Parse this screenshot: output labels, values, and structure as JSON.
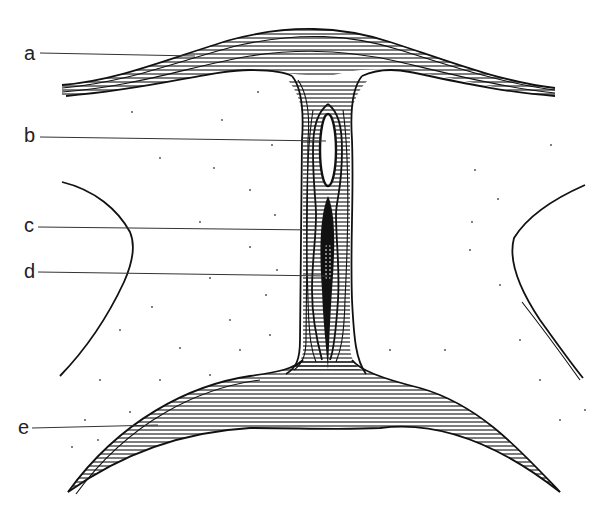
{
  "diagram": {
    "type": "anatomical line drawing (cross-section)",
    "style": "black ink on white, hatched fibrous bands, stippled tissue",
    "colors": {
      "ink": "#111111",
      "background": "#ffffff",
      "leader": "#333333"
    },
    "labels": [
      {
        "id": "a",
        "text": "a",
        "x": 24,
        "y": 60,
        "target": "upper curved fibrous band"
      },
      {
        "id": "b",
        "text": "b",
        "x": 24,
        "y": 142,
        "target": "oval lumen in central column"
      },
      {
        "id": "c",
        "text": "c",
        "x": 24,
        "y": 232,
        "target": "striated sheath around dark core"
      },
      {
        "id": "d",
        "text": "d",
        "x": 24,
        "y": 278,
        "target": "dark fusiform core with cross-hatched center"
      },
      {
        "id": "e",
        "text": "e",
        "x": 18,
        "y": 434,
        "target": "lower crescent fibrous band"
      }
    ]
  }
}
